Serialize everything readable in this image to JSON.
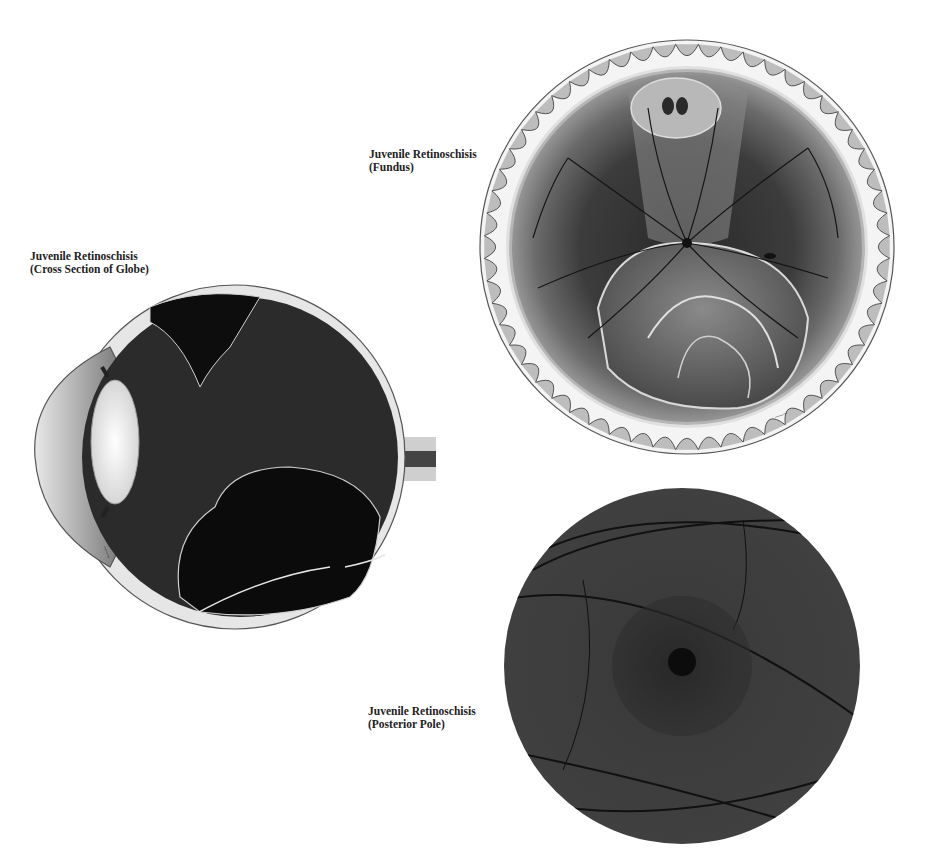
{
  "figures": [
    {
      "id": "fundus",
      "title": "Juvenile Retinoschisis",
      "subtitle": "(Fundus)"
    },
    {
      "id": "cross-section",
      "title": "Juvenile Retinoschisis",
      "subtitle": "(Cross Section of Globe)"
    },
    {
      "id": "posterior-pole",
      "title": "Juvenile Retinoschisis",
      "subtitle": "(Posterior Pole)"
    }
  ],
  "palette": {
    "background": "#ffffff",
    "text": "#222222",
    "retina_dark": "#2b2b2b",
    "retina_mid": "#5a5a5a",
    "sclera": "#e6e6e6",
    "lens": "#f2f2f2",
    "fundus_photo": "#3a3a3a"
  }
}
